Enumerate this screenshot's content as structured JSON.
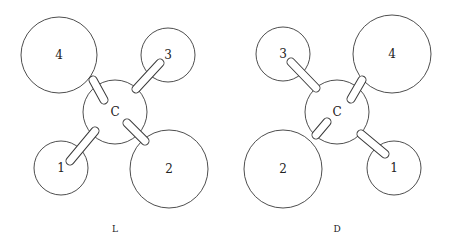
{
  "figure": {
    "panels": [
      {
        "caption": "L",
        "center": {
          "label": "C",
          "x": 115,
          "y": 112,
          "r": 32
        },
        "atoms": [
          {
            "label": "4",
            "x": 59,
            "y": 55,
            "r": 38,
            "bond": [
              93,
              80,
              104,
              100
            ]
          },
          {
            "label": "3",
            "x": 168,
            "y": 55,
            "r": 27,
            "bond": [
              136,
              89,
              160,
              63
            ]
          },
          {
            "label": "1",
            "x": 61,
            "y": 168,
            "r": 27,
            "bond": [
              95,
              131,
              70,
              161
            ]
          },
          {
            "label": "2",
            "x": 169,
            "y": 169,
            "r": 39,
            "bond": [
              127,
              123,
              145,
              141
            ]
          }
        ]
      },
      {
        "caption": "D",
        "center": {
          "label": "C",
          "x": 337,
          "y": 112,
          "r": 32
        },
        "atoms": [
          {
            "label": "3",
            "x": 283,
            "y": 54,
            "r": 27,
            "bond": [
              316,
              88,
              291,
              62
            ]
          },
          {
            "label": "4",
            "x": 392,
            "y": 54,
            "r": 39,
            "bond": [
              362,
              80,
              351,
              99
            ]
          },
          {
            "label": "2",
            "x": 283,
            "y": 169,
            "r": 39,
            "bond": [
              316,
              135,
              327,
              122
            ]
          },
          {
            "label": "1",
            "x": 394,
            "y": 168,
            "r": 27,
            "bond": [
              361,
              134,
              385,
              154
            ]
          }
        ]
      }
    ]
  }
}
